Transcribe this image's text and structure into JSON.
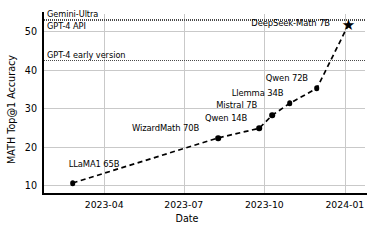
{
  "chart_data": {
    "type": "line",
    "title": "",
    "xlabel": "Date",
    "ylabel": "MATH Top@1 Accuracy",
    "xticklabels": [
      "2023-04",
      "2023-07",
      "2023-10",
      "2024-01"
    ],
    "yticklabels": [
      "10",
      "20",
      "30",
      "40",
      "50"
    ],
    "ylim": [
      8.0,
      54.5
    ],
    "grid": true,
    "legend": "none",
    "linestyle": "dashed",
    "series": [
      {
        "name": "Open-source math models",
        "points": [
          {
            "label": "LLaMA1 65B",
            "date": "2023-02-24",
            "value": 10.6,
            "marker": "circle"
          },
          {
            "label": "WizardMath 70B",
            "date": "2023-08-09",
            "value": 22.3,
            "marker": "circle"
          },
          {
            "label": "Qwen 14B",
            "date": "2023-09-25",
            "value": 24.8,
            "marker": "circle"
          },
          {
            "label": "Mistral 7B",
            "date": "2023-10-10",
            "value": 28.2,
            "marker": "circle"
          },
          {
            "label": "Llemma 34B",
            "date": "2023-10-30",
            "value": 31.3,
            "marker": "circle"
          },
          {
            "label": "Qwen 72B",
            "date": "2023-11-30",
            "value": 35.2,
            "marker": "circle"
          },
          {
            "label": "DeepSeek-Math 7B",
            "date": "2024-01-05",
            "value": 51.7,
            "marker": "star"
          }
        ]
      }
    ],
    "reference_lines": [
      {
        "label": "Gemini-Ultra",
        "value": 53.2,
        "style": "dotted"
      },
      {
        "label": "GPT-4 API",
        "value": 52.9,
        "style": "dotted"
      },
      {
        "label": "GPT-4 early version",
        "value": 42.5,
        "style": "dotted"
      }
    ],
    "colors": {
      "marker": "#000000",
      "line": "#000000",
      "grid": "#c9c9c9",
      "refline": "#4a4a4a",
      "background": "#ffffff"
    }
  }
}
